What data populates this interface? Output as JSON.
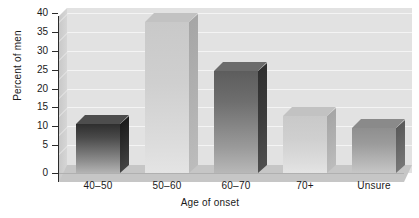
{
  "chart_data": {
    "type": "bar",
    "title": "",
    "xlabel": "Age of onset",
    "ylabel": "Percent of men",
    "categories": [
      "40–50",
      "50–60",
      "60–70",
      "70+",
      "Unsure"
    ],
    "values": [
      13,
      40,
      27,
      15,
      12
    ],
    "ylim": [
      0,
      40
    ],
    "yticks": [
      0,
      5,
      10,
      15,
      20,
      25,
      30,
      35,
      40
    ],
    "ytick_labels": [
      "0",
      "5",
      "10",
      "15",
      "20",
      "25",
      "30",
      "35",
      "40"
    ],
    "grid": true,
    "legend": null,
    "style": "3d-bar",
    "bar_styles": [
      "dark",
      "light",
      "mid",
      "light",
      "gray"
    ],
    "colors": {
      "plot_background": "#e2e2e2",
      "floor": "#c6c6c6",
      "gridline": "#f4f4f4",
      "axis": "#2b2b2b",
      "text": "#1a1a1a",
      "page_background": "#ffffff"
    }
  }
}
